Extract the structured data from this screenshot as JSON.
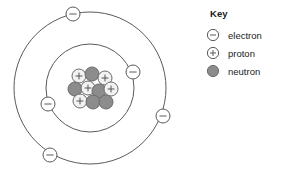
{
  "diagram": {
    "center": {
      "x": 90,
      "y": 88
    },
    "shells": [
      {
        "name": "inner-shell",
        "radius": 44
      },
      {
        "name": "outer-shell",
        "radius": 76
      }
    ],
    "stroke_color": "#5a5a5a",
    "electron_fill": "#ffffff",
    "electron_stroke": "#5a5a5a",
    "proton_fill": "#f2f2f2",
    "proton_stroke": "#6b6b6b",
    "neutron_fill": "#8c8c8c",
    "neutron_stroke": "#6b6b6b",
    "electrons": [
      {
        "name": "electron-outer-top",
        "shell": "outer",
        "x": 73,
        "y": 14,
        "symbol": "minus"
      },
      {
        "name": "electron-outer-right",
        "shell": "outer",
        "x": 163,
        "y": 116,
        "symbol": "minus"
      },
      {
        "name": "electron-outer-bottom-left",
        "shell": "outer",
        "x": 50,
        "y": 155,
        "symbol": "minus"
      },
      {
        "name": "electron-inner-right",
        "shell": "inner",
        "x": 133,
        "y": 72,
        "symbol": "minus"
      },
      {
        "name": "electron-inner-left",
        "shell": "inner",
        "x": 48,
        "y": 104,
        "symbol": "minus"
      }
    ],
    "nucleus": {
      "proton_count": 5,
      "neutron_count": 5,
      "particles": [
        {
          "name": "proton",
          "type": "proton",
          "x": 79,
          "y": 76,
          "r": 7
        },
        {
          "name": "neutron",
          "type": "neutron",
          "x": 92,
          "y": 74,
          "r": 7
        },
        {
          "name": "proton",
          "type": "proton",
          "x": 105,
          "y": 78,
          "r": 7
        },
        {
          "name": "neutron",
          "type": "neutron",
          "x": 75,
          "y": 89,
          "r": 7
        },
        {
          "name": "proton",
          "type": "proton",
          "x": 88,
          "y": 88,
          "r": 7
        },
        {
          "name": "neutron",
          "type": "neutron",
          "x": 99,
          "y": 91,
          "r": 7
        },
        {
          "name": "proton",
          "type": "proton",
          "x": 111,
          "y": 89,
          "r": 7
        },
        {
          "name": "proton",
          "type": "proton",
          "x": 80,
          "y": 101,
          "r": 7
        },
        {
          "name": "neutron",
          "type": "neutron",
          "x": 93,
          "y": 102,
          "r": 7
        },
        {
          "name": "neutron",
          "type": "neutron",
          "x": 106,
          "y": 102,
          "r": 7
        }
      ]
    }
  },
  "legend": {
    "title": "Key",
    "items": [
      {
        "label": "electron",
        "symbol": "electron-symbol"
      },
      {
        "label": "proton",
        "symbol": "proton-symbol"
      },
      {
        "label": "neutron",
        "symbol": "neutron-symbol"
      }
    ]
  }
}
